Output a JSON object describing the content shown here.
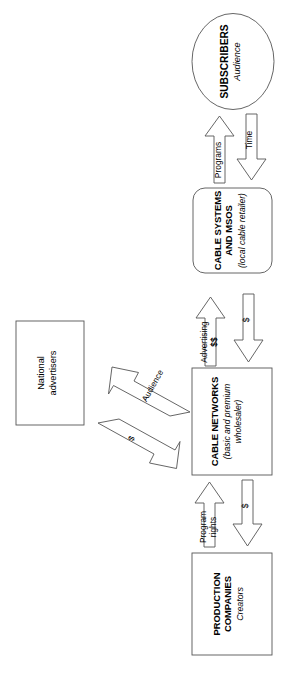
{
  "diagram": {
    "orientation": "rotated-90-clockwise",
    "type": "flow",
    "stroke_color": "#555555",
    "text_color": "#1a1a1a",
    "background_color": "#ffffff"
  },
  "nodes": [
    {
      "id": "subscribers",
      "shape": "ellipse",
      "title": "SUBSCRIBERS",
      "subtitle": "Audience"
    },
    {
      "id": "cable-systems",
      "shape": "rounded-rect",
      "title_line1": "CABLE SYSTEMS",
      "title_line2": "AND MSOS",
      "subtitle": "(local cable retailer)"
    },
    {
      "id": "cable-networks",
      "shape": "rect",
      "title": "CABLE NETWORKS",
      "subtitle_line1": "(basic and premium",
      "subtitle_line2": "wholesaler)"
    },
    {
      "id": "production-companies",
      "shape": "rect",
      "title_line1": "PRODUCTION",
      "title_line2": "COMPANIES",
      "subtitle": "Creators"
    },
    {
      "id": "national-advertisers",
      "shape": "rect",
      "title_line1": "National",
      "title_line2": "advertisers"
    }
  ],
  "flows": [
    {
      "id": "programs",
      "label": "Programs",
      "from": "cable-systems",
      "to": "subscribers"
    },
    {
      "id": "time",
      "label": "Time",
      "from": "subscribers",
      "to": "cable-systems"
    },
    {
      "id": "advertising",
      "label_line1": "Advertising",
      "label_line2": "$$",
      "from": "cable-networks",
      "to": "cable-systems"
    },
    {
      "id": "money-systems",
      "label": "$",
      "from": "cable-systems",
      "to": "cable-networks"
    },
    {
      "id": "program-rights",
      "label_line1": "Program",
      "label_line2": "rights",
      "from": "production-companies",
      "to": "cable-networks"
    },
    {
      "id": "money-networks",
      "label": "$",
      "from": "cable-networks",
      "to": "production-companies"
    },
    {
      "id": "audience",
      "label": "Audience",
      "from": "cable-networks",
      "to": "national-advertisers"
    },
    {
      "id": "money-advertisers",
      "label": "$",
      "from": "national-advertisers",
      "to": "cable-networks"
    }
  ]
}
